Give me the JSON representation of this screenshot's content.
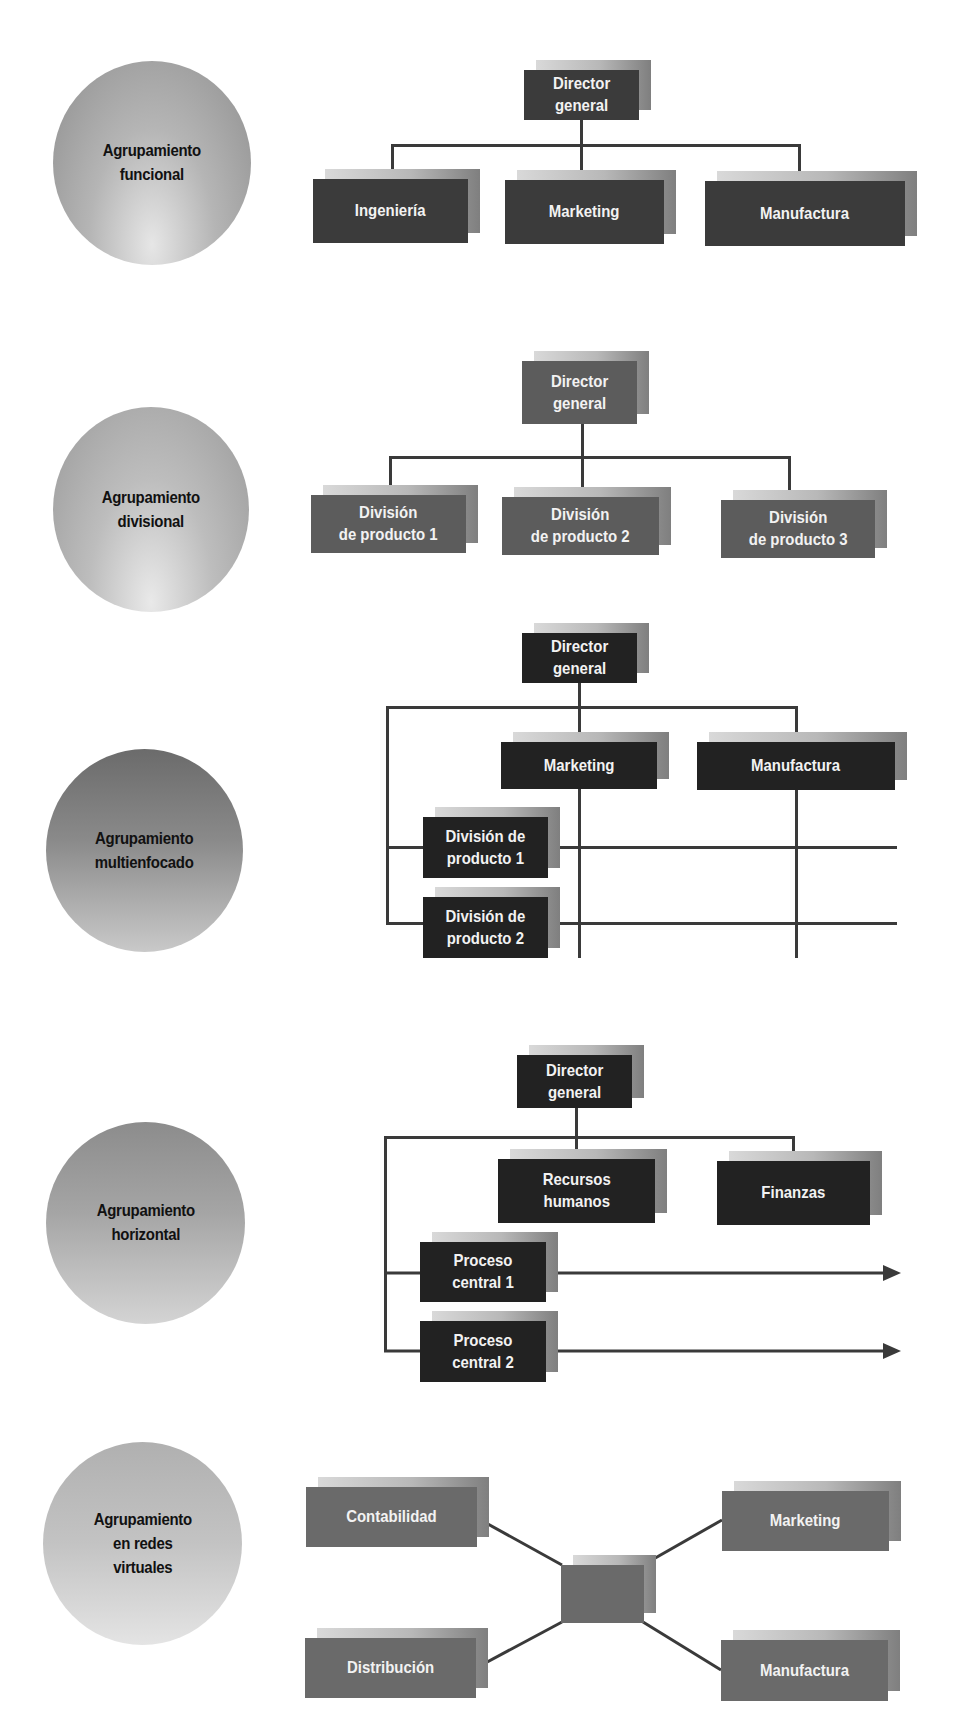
{
  "diagrams": [
    {
      "label": "Agrupamiento\nfuncional",
      "top": "Director\ngeneral",
      "children": [
        "Ingeniería",
        "Marketing",
        "Manufactura"
      ]
    },
    {
      "label": "Agrupamiento\ndivisional",
      "top": "Director\ngeneral",
      "children": [
        "División\nde producto 1",
        "División\nde producto 2",
        "División\nde producto 3"
      ]
    },
    {
      "label": "Agrupamiento\nmultienfocado",
      "top": "Director\ngeneral",
      "functions": [
        "Marketing",
        "Manufactura"
      ],
      "divisions": [
        "División de\nproducto 1",
        "División de\nproducto 2"
      ]
    },
    {
      "label": "Agrupamiento\nhorizontal",
      "top": "Director\ngeneral",
      "functions": [
        "Recursos\nhumanos",
        "Finanzas"
      ],
      "processes": [
        "Proceso\ncentral 1",
        "Proceso\ncentral 2"
      ]
    },
    {
      "label": "Agrupamiento\nen redes\nvirtuales",
      "hub": "",
      "nodes": [
        "Contabilidad",
        "Marketing",
        "Distribución",
        "Manufactura"
      ]
    }
  ]
}
